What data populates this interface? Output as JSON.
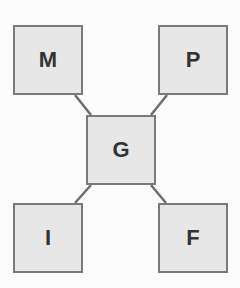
{
  "diagram": {
    "type": "hub-and-spoke",
    "colors": {
      "background": "#fbfbfb",
      "node_fill": "#e7e7e7",
      "node_border": "#7a7a7a",
      "connector": "#6e6e6e",
      "label": "#333333"
    },
    "center": {
      "id": "G",
      "label": "G",
      "x": 86,
      "y": 115,
      "w": 70,
      "h": 70
    },
    "nodes": [
      {
        "id": "M",
        "label": "M",
        "position": "top-left",
        "x": 13,
        "y": 25,
        "w": 70,
        "h": 70
      },
      {
        "id": "P",
        "label": "P",
        "position": "top-right",
        "x": 158,
        "y": 25,
        "w": 70,
        "h": 70
      },
      {
        "id": "I",
        "label": "I",
        "position": "bottom-left",
        "x": 13,
        "y": 203,
        "w": 70,
        "h": 70
      },
      {
        "id": "F",
        "label": "F",
        "position": "bottom-right",
        "x": 158,
        "y": 203,
        "w": 70,
        "h": 70
      }
    ],
    "edges": [
      {
        "from": "M",
        "to": "G",
        "x1": 75,
        "y1": 95,
        "x2": 91,
        "y2": 115
      },
      {
        "from": "P",
        "to": "G",
        "x1": 167,
        "y1": 95,
        "x2": 151,
        "y2": 115
      },
      {
        "from": "I",
        "to": "G",
        "x1": 75,
        "y1": 203,
        "x2": 91,
        "y2": 185
      },
      {
        "from": "F",
        "to": "G",
        "x1": 166,
        "y1": 203,
        "x2": 151,
        "y2": 185
      }
    ]
  }
}
